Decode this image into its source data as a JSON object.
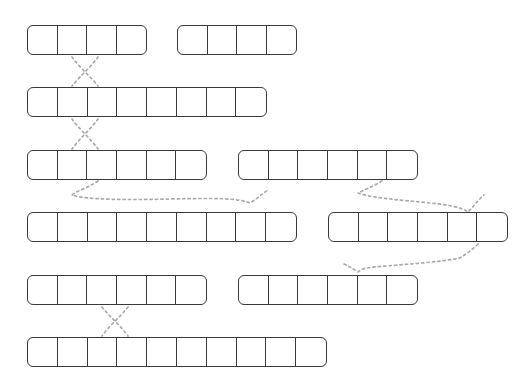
{
  "page": {
    "width": 532,
    "height": 386,
    "background_color": "#ffffff",
    "stroke_color": "#3a3a3a",
    "connector_color": "#aaaaaa"
  },
  "geometry": {
    "cell_width": 30,
    "cell_height": 30,
    "row_spacing": 62,
    "left_margin": 27,
    "first_row_top": 25
  },
  "rows": [
    {
      "index": 0,
      "top": 25,
      "strips": [
        {
          "id": "r0s0",
          "left": 27,
          "cells": 4
        },
        {
          "id": "r0s1",
          "left": 177,
          "cells": 4
        }
      ]
    },
    {
      "index": 1,
      "top": 87,
      "strips": [
        {
          "id": "r1s0",
          "left": 27,
          "cells": 8
        }
      ]
    },
    {
      "index": 2,
      "top": 150,
      "strips": [
        {
          "id": "r2s0",
          "left": 27,
          "cells": 6
        },
        {
          "id": "r2s1",
          "left": 238,
          "cells": 6
        }
      ]
    },
    {
      "index": 3,
      "top": 212,
      "strips": [
        {
          "id": "r3s0",
          "left": 27,
          "cells": 9
        },
        {
          "id": "r3s1",
          "left": 328,
          "cells": 6
        }
      ]
    },
    {
      "index": 4,
      "top": 275,
      "strips": [
        {
          "id": "r4s0",
          "left": 27,
          "cells": 6
        },
        {
          "id": "r4s1",
          "left": 238,
          "cells": 6
        }
      ]
    },
    {
      "index": 5,
      "top": 337,
      "strips": [
        {
          "id": "r5s0",
          "left": 27,
          "cells": 10
        }
      ]
    }
  ],
  "connectors": [
    {
      "id": "c0",
      "type": "cross",
      "from_row": 0,
      "to_row": 1,
      "path": "M 72,57 C 78,66 92,78 98,86 M 98,57 C 92,66 78,78 72,86"
    },
    {
      "id": "c1",
      "type": "cross",
      "from_row": 1,
      "to_row": 2,
      "path": "M 72,119 C 78,128 92,140 98,149 M 98,119 C 92,128 78,140 72,149"
    },
    {
      "id": "c2",
      "type": "swoop",
      "from_row": 2,
      "to_row": 3,
      "path": "M 98,181 C 88,188 78,190 72,195 C 86,200 130,200 170,199 C 215,198 238,198 250,203 C 258,198 262,194 268,190"
    },
    {
      "id": "c3",
      "type": "swoop",
      "from_row": 2,
      "to_row": 3,
      "path": "M 382,181 C 374,186 366,189 358,193 C 372,198 400,200 430,203 C 452,205 462,208 468,212 C 474,206 478,200 484,195"
    },
    {
      "id": "c4",
      "type": "swoop",
      "from_row": 3,
      "to_row": 4,
      "path": "M 478,244 C 472,250 466,254 460,258 C 440,262 410,264 386,266 C 370,267 362,268 358,272 C 352,268 348,266 342,263"
    },
    {
      "id": "c5",
      "type": "cross",
      "from_row": 4,
      "to_row": 5,
      "path": "M 102,307 C 108,315 122,327 128,336 M 128,307 C 122,315 108,327 102,336"
    }
  ]
}
